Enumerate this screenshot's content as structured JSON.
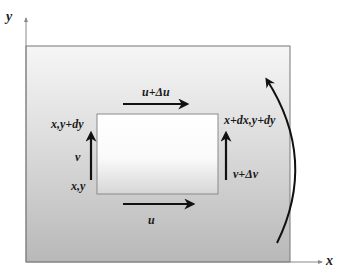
{
  "diagram": {
    "axes": {
      "x_label": "x",
      "y_label": "y"
    },
    "element": {
      "corners": {
        "bottom_left": "x,y",
        "top_left": "x,y+dy",
        "top_right": "x+dx,y+dy"
      }
    },
    "velocities": {
      "top": "u+Δu",
      "bottom": "u",
      "left": "v",
      "right": "v+Δv"
    },
    "rotation_arrow": "counterclockwise-rotation",
    "colors": {
      "domain_top": "#f4f4f4",
      "domain_bottom": "#b9b9b9",
      "element_top": "#ffffff",
      "element_bottom": "#d9d9d9",
      "arrow": "#111111",
      "axis": "#888888"
    }
  }
}
